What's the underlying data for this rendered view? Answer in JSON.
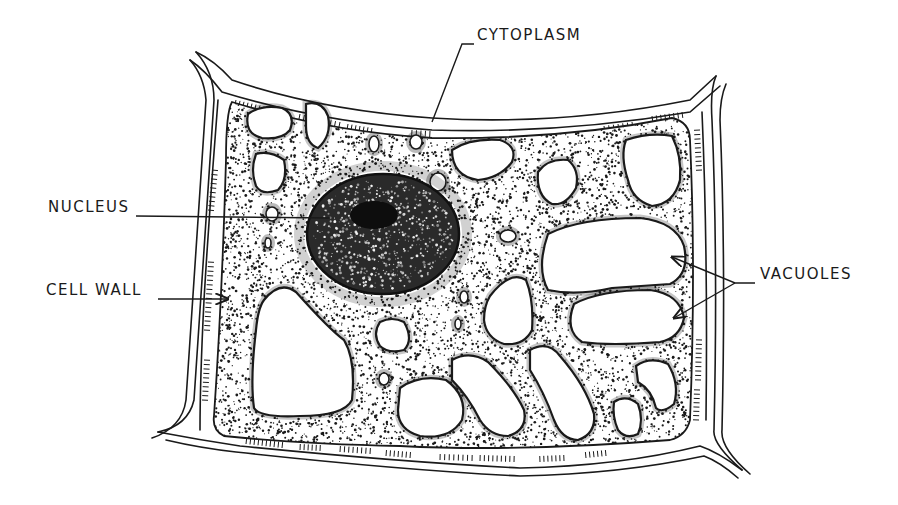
{
  "diagram": {
    "ink_color": "#1a1a1a",
    "background": "#ffffff",
    "labels": [
      {
        "id": "cytoplasm",
        "text": "CYTOPLASM",
        "x": 477,
        "y": 36
      },
      {
        "id": "nucleus",
        "text": "NUCLEUS",
        "x": 48,
        "y": 208
      },
      {
        "id": "cell_wall",
        "text": "CELL WALL",
        "x": 46,
        "y": 291
      },
      {
        "id": "vacuoles",
        "text": "VACUOLES",
        "x": 760,
        "y": 275
      }
    ],
    "leaders": [
      {
        "for": "cytoplasm",
        "points": [
          [
            474,
            44
          ],
          [
            462,
            44
          ],
          [
            432,
            122
          ]
        ],
        "arrow": false
      },
      {
        "for": "nucleus",
        "points": [
          [
            136,
            216
          ],
          [
            330,
            218
          ]
        ],
        "arrow": false
      },
      {
        "for": "cell_wall",
        "points": [
          [
            158,
            299
          ],
          [
            228,
            299
          ]
        ],
        "arrow": true
      },
      {
        "for": "vacuoles",
        "points": [
          [
            755,
            283
          ],
          [
            735,
            283
          ],
          [
            672,
            257
          ]
        ],
        "arrow": true
      },
      {
        "for": "vacuoles",
        "points": [
          [
            735,
            283
          ],
          [
            674,
            318
          ]
        ],
        "arrow": true
      }
    ],
    "cell": {
      "outer_wall": "M 196 52 Q 214 60 232 80 Q 320 110 432 118 Q 560 126 690 100 L 716 76",
      "wall_top_inner": "M 190 60 Q 205 70 222 92 Q 320 122 432 130 Q 560 134 690 112 L 720 86",
      "cytoplasm_path": "M 232 102 Q 330 132 432 138 Q 560 140 672 118 Q 690 122 690 140 Q 696 270 690 420 Q 686 436 670 440 Q 520 452 400 446 Q 300 444 224 436 Q 212 430 214 416 Q 222 300 226 160 Q 226 112 232 102 Z",
      "membrane_left": "M 218 100 Q 210 200 204 300 Q 200 380 200 430",
      "membrane_right": "M 702 112 Q 708 250 706 420",
      "bottom_wall_outer": "M 158 432 Q 200 440 240 446 Q 400 462 520 468 Q 620 466 700 446 Q 718 452 742 470",
      "bottom_wall_inner": "M 166 440 Q 200 448 236 452 Q 400 470 520 476 Q 620 474 704 456 Q 720 462 738 478",
      "right_wall_outer": "M 716 76 Q 710 90 712 120 Q 718 260 714 430 Q 712 444 742 470",
      "right_wall_inner": "M 726 84 Q 720 98 720 120 Q 726 260 722 430 Q 720 448 750 474",
      "left_wall_outer": "M 196 52 Q 214 72 214 100 Q 204 250 194 400 Q 188 426 158 432",
      "left_wall_inner": "M 190 60 Q 204 76 206 100 Q 196 250 186 400 Q 182 428 152 438"
    },
    "nucleus": {
      "cx": 383,
      "cy": 234,
      "rx": 76,
      "ry": 60,
      "nucleolus": {
        "cx": 374,
        "cy": 215,
        "rx": 24,
        "ry": 14
      }
    },
    "vacuoles": [
      "M 248 114 Q 262 104 282 108 Q 296 114 290 130 Q 282 140 262 138 Q 244 134 248 114 Z",
      "M 306 104 Q 322 100 328 116 Q 332 136 318 148 Q 306 144 306 126 Z",
      "M 256 154 Q 270 150 284 160 Q 288 180 278 190 Q 262 196 256 186 Q 250 170 256 154 Z",
      "M 452 150 Q 470 138 500 140 Q 518 146 512 162 Q 500 178 478 180 Q 452 176 452 150 Z",
      "M 538 172 Q 548 158 568 160 Q 580 170 576 188 Q 566 206 552 204 Q 536 196 538 172 Z",
      "M 626 140 Q 650 132 672 136 Q 682 156 680 180 Q 674 204 652 206 Q 632 200 628 180 Q 620 156 626 140 Z",
      "M 548 234 Q 580 218 640 218 Q 676 222 684 246 Q 690 274 670 284 Q 640 286 612 288 Q 576 296 548 290 Q 536 268 548 234 Z",
      "M 574 304 Q 600 290 650 290 Q 680 294 684 318 Q 680 338 660 342 Q 610 346 582 342 Q 564 330 574 304 Z",
      "M 264 300 Q 280 280 296 292 Q 330 330 344 340 Q 356 360 352 400 Q 344 416 300 416 Q 260 418 254 408 Q 250 380 256 330 Q 258 308 264 300 Z",
      "M 490 296 Q 510 270 526 280 Q 534 300 532 330 Q 524 346 504 344 Q 486 338 484 320 Q 484 306 490 296 Z",
      "M 380 322 Q 392 316 404 322 Q 414 340 404 350 Q 388 354 380 346 Q 372 334 380 322 Z",
      "M 400 388 Q 420 374 446 380 Q 468 396 462 420 Q 450 440 420 436 Q 398 430 398 410 Z",
      "M 452 360 Q 470 350 488 362 Q 514 388 524 410 Q 528 430 508 436 Q 490 436 480 420 Q 468 396 452 380 Z",
      "M 530 350 Q 548 340 560 356 Q 586 386 594 414 Q 596 434 578 440 Q 562 440 554 420 Q 544 392 530 370 Z",
      "M 614 402 Q 626 394 638 404 Q 644 420 638 434 Q 626 440 618 430 Q 612 416 614 402 Z",
      "M 636 366 Q 650 356 668 364 Q 680 384 674 404 Q 662 414 656 408 Q 652 390 638 382 Z"
    ],
    "small_vacuoles": [
      {
        "cx": 374,
        "cy": 144,
        "rx": 5,
        "ry": 8
      },
      {
        "cx": 416,
        "cy": 142,
        "rx": 6,
        "ry": 7
      },
      {
        "cx": 438,
        "cy": 182,
        "rx": 8,
        "ry": 9
      },
      {
        "cx": 508,
        "cy": 236,
        "rx": 8,
        "ry": 6
      },
      {
        "cx": 272,
        "cy": 214,
        "rx": 6,
        "ry": 7
      },
      {
        "cx": 268,
        "cy": 243,
        "rx": 3,
        "ry": 5
      },
      {
        "cx": 464,
        "cy": 297,
        "rx": 4,
        "ry": 6
      },
      {
        "cx": 458,
        "cy": 324,
        "rx": 3,
        "ry": 5
      },
      {
        "cx": 384,
        "cy": 379,
        "rx": 5,
        "ry": 6
      }
    ],
    "stipple_seed": 7
  }
}
